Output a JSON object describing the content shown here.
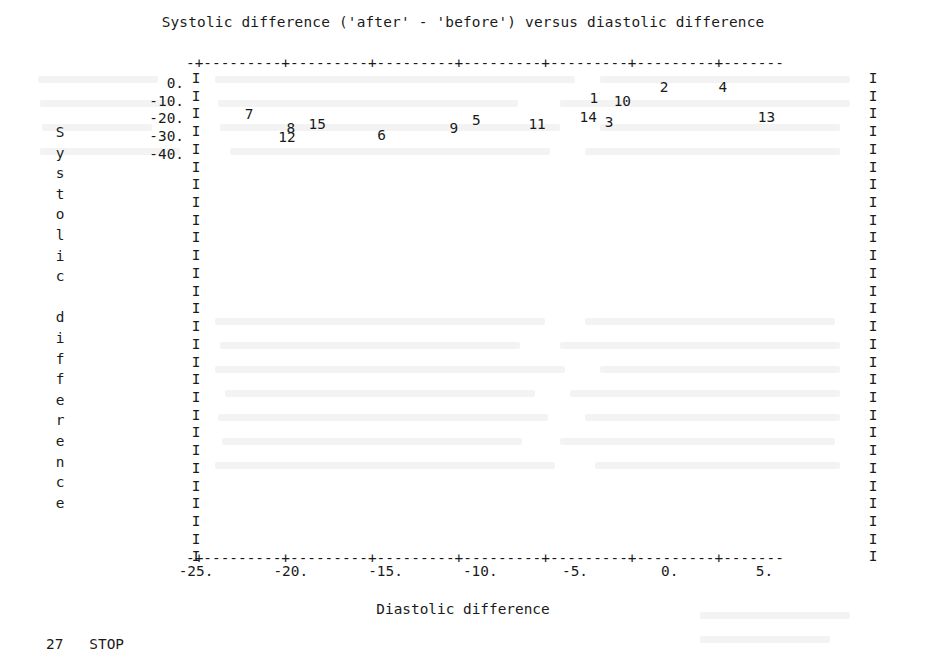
{
  "title": "Systolic difference ('after' - 'before') versus diastolic difference",
  "axis": {
    "y_title_chars": [
      "S",
      "y",
      "s",
      "t",
      "o",
      "l",
      "i",
      "c",
      "",
      "d",
      "i",
      "f",
      "f",
      "e",
      "r",
      "e",
      "n",
      "c",
      "e"
    ],
    "x_title": "Diastolic difference",
    "vertical_axis_glyph": "I",
    "horizontal_rule": "-+---------+---------+---------+---------+---------+---------+-------"
  },
  "footer": {
    "line_number": "27",
    "command": "STOP"
  },
  "chart_data": {
    "type": "scatter",
    "title": "Systolic difference ('after' - 'before') versus diastolic difference",
    "xlabel": "Diastolic difference",
    "ylabel": "Systolic difference",
    "xlim": [
      -25.8,
      7.0
    ],
    "ylim": [
      -41.5,
      1.0
    ],
    "xticks": [
      -25,
      -20,
      -15,
      -10,
      -5,
      0,
      5
    ],
    "xtick_labels": [
      "-25.",
      "-20.",
      "-15.",
      "-10.",
      "-5.",
      "0.",
      "5."
    ],
    "yticks": [
      0,
      -10,
      -20,
      -30,
      -40
    ],
    "ytick_labels": [
      "0.",
      "-10.",
      "-20.",
      "-30.",
      "-40."
    ],
    "grid": false,
    "legend": false,
    "point_marker": "case-number-label",
    "points": [
      {
        "label": "1",
        "x": -4.0,
        "y": -8.5
      },
      {
        "label": "2",
        "x": -0.3,
        "y": -2.4
      },
      {
        "label": "4",
        "x": 2.8,
        "y": -2.4
      },
      {
        "label": "10",
        "x": -2.5,
        "y": -10.0
      },
      {
        "label": "7",
        "x": -22.2,
        "y": -17.5
      },
      {
        "label": "14",
        "x": -4.3,
        "y": -19.2
      },
      {
        "label": "13",
        "x": 5.1,
        "y": -19.2
      },
      {
        "label": "5",
        "x": -10.2,
        "y": -20.7
      },
      {
        "label": "3",
        "x": -3.2,
        "y": -22.2
      },
      {
        "label": "15",
        "x": -18.6,
        "y": -23.3
      },
      {
        "label": "11",
        "x": -7.0,
        "y": -23.3
      },
      {
        "label": "8",
        "x": -20.0,
        "y": -25.3
      },
      {
        "label": "9",
        "x": -11.4,
        "y": -25.3
      },
      {
        "label": "6",
        "x": -15.2,
        "y": -29.5
      },
      {
        "label": "12",
        "x": -20.2,
        "y": -30.5
      }
    ]
  }
}
